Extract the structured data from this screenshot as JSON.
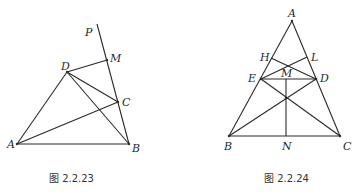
{
  "figures": [
    {
      "caption": "图 2.2.23",
      "labels": {
        "P": "P",
        "M": "M",
        "D": "D",
        "C": "C",
        "A": "A",
        "B": "B"
      },
      "points": {
        "Ptop": [
          97,
          24
        ],
        "M": [
          107,
          60
        ],
        "D": [
          67,
          72
        ],
        "C": [
          118,
          102
        ],
        "A": [
          17,
          144
        ],
        "B": [
          129,
          144
        ]
      },
      "segments": [
        [
          "Ptop",
          "B"
        ],
        [
          "D",
          "M"
        ],
        [
          "A",
          "D"
        ],
        [
          "D",
          "C"
        ],
        [
          "D",
          "B"
        ],
        [
          "A",
          "C"
        ],
        [
          "A",
          "B"
        ]
      ]
    },
    {
      "caption": "图 2.2.24",
      "labels": {
        "A": "A",
        "H": "H",
        "L": "L",
        "E": "E",
        "M": "M",
        "D": "D",
        "B": "B",
        "N": "N",
        "C": "C"
      },
      "points": {
        "A": [
          292,
          21
        ],
        "H": [
          271,
          58
        ],
        "L": [
          307,
          57
        ],
        "E": [
          261,
          79
        ],
        "D": [
          316,
          79
        ],
        "M": [
          286,
          79
        ],
        "O": [
          286,
          98
        ],
        "B": [
          229,
          136
        ],
        "C": [
          340,
          136
        ],
        "N": [
          286,
          136
        ]
      },
      "segments": [
        [
          "A",
          "B"
        ],
        [
          "A",
          "C"
        ],
        [
          "B",
          "C"
        ],
        [
          "E",
          "D"
        ],
        [
          "H",
          "D"
        ],
        [
          "E",
          "L"
        ],
        [
          "B",
          "D"
        ],
        [
          "E",
          "C"
        ],
        [
          "M",
          "N"
        ]
      ]
    }
  ]
}
